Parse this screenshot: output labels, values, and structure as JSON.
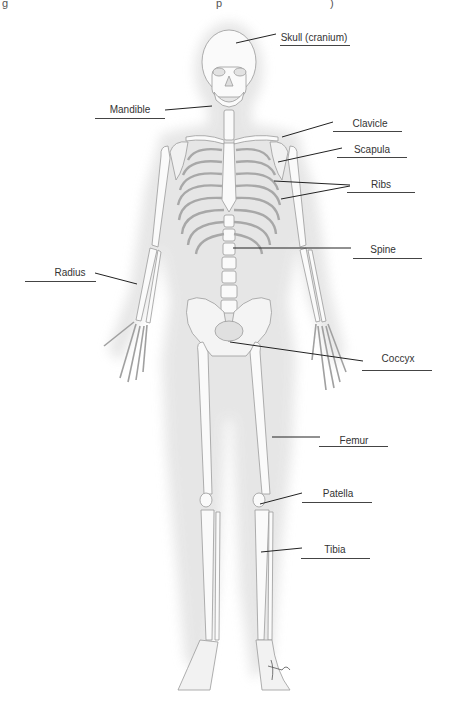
{
  "diagram": {
    "title_fragment": [
      "g",
      "p",
      ")"
    ],
    "artist_signature": "tina",
    "labels": [
      {
        "id": "skull",
        "text": "Skull (cranium)",
        "tx": 314,
        "ty": 32,
        "line": {
          "x1": 280,
          "x2": 350,
          "y": 45
        },
        "leader": [
          [
            236,
            43
          ],
          [
            276,
            34
          ]
        ]
      },
      {
        "id": "mandible",
        "text": "Mandible",
        "tx": 130,
        "ty": 104,
        "line": {
          "x1": 95,
          "x2": 165,
          "y": 118
        },
        "leader": [
          [
            165,
            110
          ],
          [
            212,
            106
          ]
        ]
      },
      {
        "id": "clavicle",
        "text": "Clavicle",
        "tx": 370,
        "ty": 118,
        "line": {
          "x1": 333,
          "x2": 402,
          "y": 131
        },
        "leader": [
          [
            282,
            137
          ],
          [
            333,
            122
          ]
        ]
      },
      {
        "id": "scapula",
        "text": "Scapula",
        "tx": 372,
        "ty": 144,
        "line": {
          "x1": 337,
          "x2": 407,
          "y": 157
        },
        "leader": [
          [
            278,
            162
          ],
          [
            342,
            148
          ]
        ]
      },
      {
        "id": "ribs",
        "text": "Ribs",
        "tx": 381,
        "ty": 179,
        "line": {
          "x1": 347,
          "x2": 415,
          "y": 192
        },
        "leader": [
          [
            274,
            181
          ],
          [
            350,
            185
          ]
        ],
        "leader2": [
          [
            281,
            199
          ],
          [
            350,
            186
          ]
        ]
      },
      {
        "id": "spine",
        "text": "Spine",
        "tx": 383,
        "ty": 244,
        "line": {
          "x1": 353,
          "x2": 422,
          "y": 258
        },
        "leader": [
          [
            233,
            248
          ],
          [
            351,
            248
          ]
        ]
      },
      {
        "id": "radius",
        "text": "Radius",
        "tx": 70,
        "ty": 267,
        "line": {
          "x1": 25,
          "x2": 96,
          "y": 281
        },
        "leader": [
          [
            95,
            273
          ],
          [
            137,
            284
          ]
        ]
      },
      {
        "id": "coccyx",
        "text": "Coccyx",
        "tx": 398,
        "ty": 353,
        "line": {
          "x1": 362,
          "x2": 432,
          "y": 370
        },
        "leader": [
          [
            230,
            342
          ],
          [
            363,
            361
          ]
        ]
      },
      {
        "id": "femur",
        "text": "Femur",
        "tx": 354,
        "ty": 435,
        "line": {
          "x1": 319,
          "x2": 388,
          "y": 446
        },
        "leader": [
          [
            272,
            437
          ],
          [
            320,
            437
          ]
        ]
      },
      {
        "id": "patella",
        "text": "Patella",
        "tx": 338,
        "ty": 488,
        "line": {
          "x1": 302,
          "x2": 372,
          "y": 502
        },
        "leader": [
          [
            260,
            504
          ],
          [
            302,
            493
          ]
        ]
      },
      {
        "id": "tibia",
        "text": "Tibia",
        "tx": 335,
        "ty": 544,
        "line": {
          "x1": 301,
          "x2": 370,
          "y": 558
        },
        "leader": [
          [
            261,
            552
          ],
          [
            302,
            548
          ]
        ]
      }
    ]
  }
}
